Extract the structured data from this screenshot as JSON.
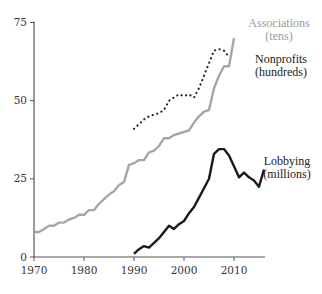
{
  "chart_data": {
    "type": "line",
    "title": "",
    "xlabel": "",
    "ylabel": "",
    "xlim": [
      1970,
      2016
    ],
    "ylim": [
      0,
      75
    ],
    "grid": false,
    "legend": "inline labels at right end of each series",
    "x_ticks": [
      1970,
      1980,
      1990,
      2000,
      2010
    ],
    "y_ticks": [
      0,
      25,
      50,
      75
    ],
    "series": [
      {
        "name": "Associations (tens)",
        "label_lines": [
          "Associations",
          "(tens)"
        ],
        "color": "#a6a6a6",
        "style": "solid",
        "x": [
          1970,
          1971,
          1972,
          1973,
          1974,
          1975,
          1976,
          1977,
          1978,
          1979,
          1980,
          1981,
          1982,
          1983,
          1984,
          1985,
          1986,
          1987,
          1988,
          1989,
          1990,
          1991,
          1992,
          1993,
          1994,
          1995,
          1996,
          1997,
          1998,
          1999,
          2000,
          2001,
          2002,
          2003,
          2004,
          2005,
          2006,
          2007,
          2008,
          2009,
          2010
        ],
        "values": [
          8,
          8,
          9,
          10,
          10,
          11,
          11,
          12,
          12.5,
          13.5,
          13.5,
          15,
          15,
          17,
          18.5,
          20,
          21,
          23,
          24,
          29.5,
          30,
          31,
          31,
          33.5,
          34,
          35.5,
          38,
          38,
          39,
          39.5,
          40,
          40.5,
          43,
          45,
          46.5,
          47,
          54,
          58,
          61,
          61,
          70
        ]
      },
      {
        "name": "Nonprofits (hundreds)",
        "label_lines": [
          "Nonprofits",
          "(hundreds)"
        ],
        "color": "#222222",
        "style": "dotted",
        "x": [
          1990,
          1991,
          1992,
          1993,
          1994,
          1995,
          1996,
          1997,
          1998,
          1999,
          2000,
          2001,
          2002,
          2003,
          2004,
          2005,
          2006,
          2007,
          2008,
          2009
        ],
        "values": [
          41,
          42.5,
          44,
          45,
          45.5,
          46,
          47,
          50,
          51,
          52,
          51.5,
          52,
          51,
          54,
          58,
          62,
          66,
          66.5,
          66,
          64
        ]
      },
      {
        "name": "Lobbying (millions)",
        "label_lines": [
          "Lobbying",
          "(millions)"
        ],
        "color": "#1a1a1a",
        "style": "solid",
        "x": [
          1990,
          1991,
          1992,
          1993,
          1994,
          1995,
          1996,
          1997,
          1998,
          1999,
          2000,
          2001,
          2002,
          2003,
          2004,
          2005,
          2006,
          2007,
          2008,
          2009,
          2010,
          2011,
          2012,
          2013,
          2014,
          2015,
          2016
        ],
        "values": [
          1,
          2.5,
          3.5,
          3,
          4.5,
          6,
          8,
          10,
          9,
          10.5,
          11.5,
          14,
          16,
          19,
          22,
          25,
          33,
          34.5,
          34.5,
          32.5,
          29,
          25.5,
          27,
          25.5,
          24.5,
          22.5,
          28
        ]
      }
    ]
  },
  "axis": {
    "color": "#555555"
  }
}
